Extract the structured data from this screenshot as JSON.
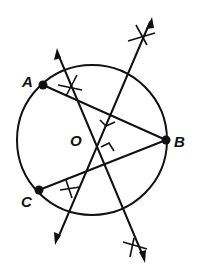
{
  "diagram": {
    "points": [
      {
        "label": "A",
        "role": "point-on-circle"
      },
      {
        "label": "B",
        "role": "point-on-circle"
      },
      {
        "label": "C",
        "role": "point-on-circle"
      },
      {
        "label": "O",
        "role": "center"
      }
    ],
    "segments": [
      {
        "from": "A",
        "to": "B"
      },
      {
        "from": "C",
        "to": "B"
      }
    ],
    "bisectors": [
      {
        "of": "AB",
        "marks": "right-angle",
        "construction_arcs": 2,
        "arrows": 2
      },
      {
        "of": "CB",
        "marks": "right-angle",
        "construction_arcs": 2,
        "arrows": 2
      }
    ],
    "colors": {
      "ink": "#111111",
      "background": "#ffffff"
    }
  }
}
